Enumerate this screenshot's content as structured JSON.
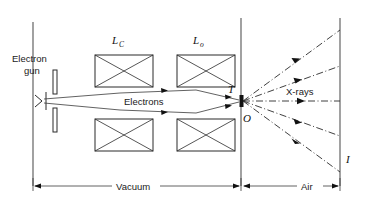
{
  "figure": {
    "type": "schematic-diagram",
    "background_color": "#ffffff",
    "line_color": "#2b2b2b"
  },
  "labels": {
    "electron_gun_line1": "Electron",
    "electron_gun_line2": "gun",
    "condenser_lens": "L",
    "condenser_lens_sub": "C",
    "objective_lens": "L",
    "objective_lens_sub": "o",
    "electrons": "Electrons",
    "target": "T",
    "origin": "O",
    "xrays": "X-rays",
    "image_plane": "I",
    "vacuum": "Vacuum",
    "air": "Air"
  },
  "components": [
    {
      "name": "electron-gun",
      "label": "Electron gun",
      "x": 33,
      "y": 101
    },
    {
      "name": "condenser-lens",
      "label": "L_C",
      "x": 124,
      "y": 101
    },
    {
      "name": "objective-lens",
      "label": "L_o",
      "x": 205,
      "y": 101
    },
    {
      "name": "target",
      "label": "T",
      "x": 241,
      "y": 101
    },
    {
      "name": "focal-point",
      "label": "O",
      "x": 243,
      "y": 101
    },
    {
      "name": "image-plane",
      "label": "I",
      "x": 340,
      "y": 101
    }
  ],
  "regions": [
    {
      "name": "vacuum",
      "label": "Vacuum",
      "from_x": 33,
      "to_x": 241
    },
    {
      "name": "air",
      "label": "Air",
      "from_x": 241,
      "to_x": 340
    }
  ],
  "beams": {
    "electron_beam_label": "Electrons",
    "xray_fan_label": "X-rays",
    "xray_ray_count": 5
  }
}
